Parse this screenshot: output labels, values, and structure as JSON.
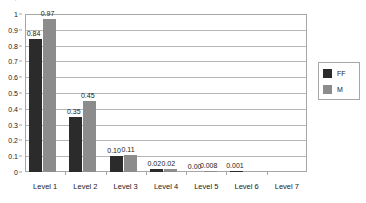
{
  "clipped_title": ". ,  .",
  "chart_data": {
    "type": "bar",
    "title": "",
    "subtitle": "",
    "xlabel": "",
    "ylabel": "",
    "ylim": [
      0,
      1
    ],
    "ytick_step": 0.1,
    "ytick_labels": [
      "1",
      "0.9",
      "0.8",
      "0.7",
      "0.6",
      "0.5",
      "0.4",
      "0.3",
      "0.2",
      "0.1",
      "0"
    ],
    "grid": "horizontal",
    "legend_position": "right",
    "categories": [
      "Level 1",
      "Level 2",
      "Level 3",
      "Level 4",
      "Level 5",
      "Level 6",
      "Level 7"
    ],
    "series": [
      {
        "name": "FF",
        "color": "#2b2b2b",
        "values": [
          0.84,
          0.35,
          0.1,
          0.02,
          0.0,
          0.001,
          null
        ],
        "labels": [
          "0.84",
          "0.35",
          "0.10",
          "0.02",
          "0.00",
          "0.001",
          ""
        ]
      },
      {
        "name": "M",
        "color": "#8c8c8c",
        "values": [
          0.97,
          0.45,
          0.11,
          0.02,
          0.008,
          null,
          null
        ],
        "labels": [
          "0.97",
          "0.45",
          "0.11",
          "0.02",
          "0.008",
          "",
          ""
        ]
      }
    ]
  },
  "legend": {
    "items": [
      {
        "label": "FF",
        "color": "#2b2b2b"
      },
      {
        "label": "M",
        "color": "#8c8c8c"
      }
    ]
  },
  "colors": {
    "series_ff": "#2b2b2b",
    "series_m": "#8c8c8c",
    "gridline": "#b5b5b5",
    "axis": "#a6a6a6",
    "background": "#ffffff",
    "text": "#1a1a1a"
  }
}
